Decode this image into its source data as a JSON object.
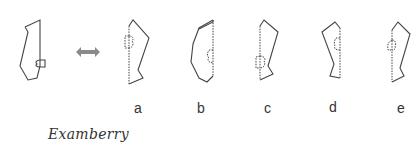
{
  "puzzle": {
    "type": "mirror-image-selection",
    "reference_label": "",
    "options": [
      {
        "label": "a"
      },
      {
        "label": "b"
      },
      {
        "label": "c"
      },
      {
        "label": "d"
      },
      {
        "label": "e"
      }
    ],
    "arrow_icon": "double-headed-arrow",
    "arrow_color": "#8a8a8a",
    "line_color": "#444444"
  },
  "footer": {
    "brand": "Examberry"
  }
}
